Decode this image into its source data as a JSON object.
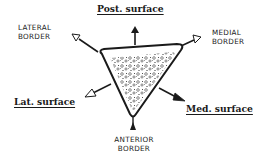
{
  "diagram": {
    "type": "anatomical cross-section",
    "shape": "triangle",
    "fill": "cancellous bone texture",
    "colors": {
      "ink": "#1a1a1a",
      "background": "#ffffff"
    },
    "surfaces": {
      "posterior": "Post. surface",
      "lateral": "Lat. surface",
      "medial": "Med. surface"
    },
    "borders": {
      "lateral": [
        "LATERAL",
        "BORDER"
      ],
      "medial": [
        "MEDIAL",
        "BORDER"
      ],
      "anterior": [
        "ANTERIOR",
        "BORDER"
      ]
    }
  }
}
